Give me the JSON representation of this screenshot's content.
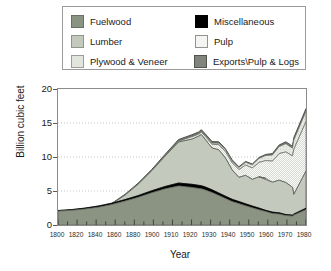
{
  "legend": {
    "items": [
      {
        "label": "Fuelwood",
        "key": "fuelwood",
        "color": "#8b9383",
        "swatch": "sw-fuelwood"
      },
      {
        "label": "Miscellaneous",
        "key": "misc",
        "color": "#000000",
        "swatch": "sw-misc"
      },
      {
        "label": "Lumber",
        "key": "lumber",
        "color": "#c3cabd",
        "swatch": "sw-lumber"
      },
      {
        "label": "Pulp",
        "key": "pulp",
        "color": "#f4f5f2",
        "swatch": "sw-pulp"
      },
      {
        "label": "Plywood & Veneer",
        "key": "plywood",
        "color": "#e2e5de",
        "swatch": "sw-plywood"
      },
      {
        "label": "Exports\\Pulp & Logs",
        "key": "exports",
        "color": "#7f857c",
        "swatch": "sw-exports"
      }
    ]
  },
  "axes": {
    "ylabel": "Billion cubic feet",
    "xlabel": "Year",
    "yticks": [
      "0",
      "5",
      "10",
      "15",
      "20"
    ],
    "xticks": [
      "1800",
      "1820",
      "1840",
      "1860",
      "1880",
      "1900",
      "1910",
      "1920",
      "1930",
      "1940",
      "1950",
      "1960",
      "1970",
      "1980"
    ]
  },
  "chart_data": {
    "type": "area",
    "stacked": true,
    "title": "",
    "xlabel": "Year",
    "ylabel": "Billion cubic feet",
    "ylim": [
      0,
      20
    ],
    "xlim": [
      1800,
      1986
    ],
    "grid": "horizontal-dotted",
    "legend_position": "above-plot",
    "axis_scale_note": "X axis uses 20-year steps from 1800 to 1900, then 10-year steps to 1980; tick spacing is uniform in pixels.",
    "tick_positions": [
      1800,
      1820,
      1840,
      1860,
      1880,
      1900,
      1910,
      1920,
      1930,
      1940,
      1950,
      1960,
      1970,
      1980
    ],
    "x": [
      1800,
      1810,
      1820,
      1830,
      1840,
      1850,
      1860,
      1870,
      1880,
      1890,
      1900,
      1905,
      1907,
      1910,
      1915,
      1920,
      1925,
      1930,
      1935,
      1940,
      1945,
      1950,
      1955,
      1960,
      1965,
      1970,
      1975,
      1976,
      1980,
      1986
    ],
    "series": [
      {
        "name": "Fuelwood",
        "values": [
          0.55,
          0.8,
          1.1,
          1.5,
          2.0,
          2.6,
          3.2,
          3.7,
          4.2,
          4.5,
          4.7,
          4.6,
          4.55,
          4.5,
          4.3,
          4.1,
          3.7,
          3.3,
          3.0,
          2.7,
          2.4,
          2.1,
          1.8,
          1.55,
          1.3,
          1.1,
          1.0,
          1.05,
          1.6,
          2.3
        ]
      },
      {
        "name": "Miscellaneous",
        "values": [
          0.08,
          0.1,
          0.12,
          0.15,
          0.18,
          0.22,
          0.25,
          0.3,
          0.35,
          0.4,
          0.45,
          0.45,
          0.45,
          0.44,
          0.42,
          0.4,
          0.36,
          0.33,
          0.3,
          0.28,
          0.26,
          0.24,
          0.22,
          0.2,
          0.18,
          0.16,
          0.15,
          0.15,
          0.18,
          0.22
        ]
      },
      {
        "name": "Lumber",
        "values": [
          0.05,
          0.12,
          0.25,
          0.5,
          0.9,
          1.6,
          2.6,
          4.0,
          5.6,
          7.3,
          7.6,
          8.0,
          8.3,
          7.6,
          6.6,
          6.4,
          5.6,
          4.3,
          3.6,
          4.2,
          3.9,
          4.6,
          4.7,
          4.4,
          4.8,
          4.7,
          4.1,
          4.6,
          5.0,
          5.4
        ]
      },
      {
        "name": "Pulp",
        "values": [
          0.0,
          0.0,
          0.0,
          0.0,
          0.0,
          0.0,
          0.0,
          0.02,
          0.05,
          0.12,
          0.22,
          0.3,
          0.35,
          0.45,
          0.55,
          0.75,
          0.95,
          1.05,
          1.15,
          1.5,
          1.7,
          2.1,
          2.6,
          3.1,
          3.9,
          4.5,
          4.6,
          5.2,
          6.6,
          7.3
        ]
      },
      {
        "name": "Plywood & Veneer",
        "values": [
          0.0,
          0.0,
          0.0,
          0.0,
          0.0,
          0.0,
          0.0,
          0.0,
          0.02,
          0.05,
          0.08,
          0.1,
          0.12,
          0.15,
          0.18,
          0.22,
          0.26,
          0.28,
          0.3,
          0.4,
          0.45,
          0.6,
          0.75,
          0.9,
          1.05,
          1.2,
          1.15,
          1.25,
          1.4,
          1.5
        ]
      },
      {
        "name": "Exports\\Pulp & Logs",
        "values": [
          0.02,
          0.03,
          0.04,
          0.06,
          0.08,
          0.1,
          0.12,
          0.15,
          0.18,
          0.2,
          0.22,
          0.24,
          0.25,
          0.24,
          0.22,
          0.2,
          0.18,
          0.16,
          0.14,
          0.13,
          0.12,
          0.14,
          0.16,
          0.2,
          0.24,
          0.28,
          0.3,
          0.32,
          0.36,
          0.4
        ]
      }
    ],
    "totals": [
      0.7,
      1.05,
      1.51,
      2.21,
      3.16,
      4.52,
      6.17,
      8.17,
      10.4,
      12.57,
      13.27,
      13.69,
      14.02,
      13.38,
      12.27,
      12.07,
      11.05,
      9.42,
      8.49,
      9.21,
      8.83,
      9.78,
      10.23,
      10.35,
      11.47,
      11.94,
      11.3,
      12.57,
      15.14,
      17.12
    ],
    "peak_early": {
      "year": 1907,
      "value": 14.0
    },
    "peak_late": {
      "year": 1986,
      "value": 17.1
    },
    "trough": {
      "year": 1932,
      "value": 8.2
    }
  }
}
